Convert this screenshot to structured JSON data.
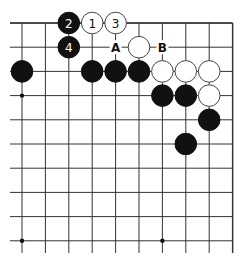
{
  "diagram": {
    "type": "go-board-fragment",
    "corner": "top-right",
    "columns": 10,
    "rows": 10,
    "colors": {
      "background": "#ffffff",
      "line": "#333333",
      "black_stone": "#111111",
      "white_stone": "#ffffff",
      "stone_outline": "#444444"
    },
    "star_points": [
      {
        "col": 0,
        "row": 3
      },
      {
        "col": 0,
        "row": 9
      },
      {
        "col": 6,
        "row": 9
      }
    ],
    "stones": [
      {
        "color": "black",
        "col": 2,
        "row": 0,
        "label": "2"
      },
      {
        "color": "white",
        "col": 3,
        "row": 0,
        "label": "1"
      },
      {
        "color": "white",
        "col": 4,
        "row": 0,
        "label": "3"
      },
      {
        "color": "black",
        "col": 2,
        "row": 1,
        "label": "4"
      },
      {
        "color": "white",
        "col": 5,
        "row": 1,
        "label": ""
      },
      {
        "color": "black",
        "col": 0,
        "row": 2,
        "label": ""
      },
      {
        "color": "black",
        "col": 3,
        "row": 2,
        "label": ""
      },
      {
        "color": "black",
        "col": 4,
        "row": 2,
        "label": ""
      },
      {
        "color": "black",
        "col": 5,
        "row": 2,
        "label": ""
      },
      {
        "color": "white",
        "col": 6,
        "row": 2,
        "label": ""
      },
      {
        "color": "white",
        "col": 7,
        "row": 2,
        "label": ""
      },
      {
        "color": "white",
        "col": 8,
        "row": 2,
        "label": ""
      },
      {
        "color": "black",
        "col": 6,
        "row": 3,
        "label": ""
      },
      {
        "color": "black",
        "col": 7,
        "row": 3,
        "label": ""
      },
      {
        "color": "white",
        "col": 8,
        "row": 3,
        "label": ""
      },
      {
        "color": "black",
        "col": 8,
        "row": 4,
        "label": ""
      },
      {
        "color": "black",
        "col": 7,
        "row": 5,
        "label": ""
      }
    ],
    "markers": [
      {
        "col": 4,
        "row": 1,
        "label": "A"
      },
      {
        "col": 6,
        "row": 1,
        "label": "B"
      }
    ]
  }
}
